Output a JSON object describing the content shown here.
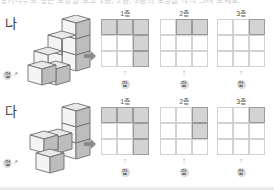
{
  "header": {
    "clipped_text": "쌓기나무로 쌓은 모양을 보고 1층, 2층, 3층의 모양을 각각 그려 보세요."
  },
  "front_marker": {
    "label": "앞"
  },
  "rows": [
    {
      "label": "나",
      "layers": [
        {
          "label": "1층",
          "cells": [
            1,
            1,
            1,
            0,
            0,
            1,
            0,
            0,
            1
          ]
        },
        {
          "label": "2층",
          "cells": [
            0,
            1,
            1,
            0,
            0,
            0,
            0,
            0,
            0
          ]
        },
        {
          "label": "3층",
          "cells": [
            0,
            0,
            1,
            0,
            0,
            0,
            0,
            0,
            0
          ]
        }
      ]
    },
    {
      "label": "다",
      "layers": [
        {
          "label": "1층",
          "cells": [
            1,
            1,
            1,
            0,
            0,
            1,
            0,
            0,
            1
          ]
        },
        {
          "label": "2층",
          "cells": [
            0,
            0,
            1,
            0,
            0,
            1,
            0,
            0,
            0
          ]
        },
        {
          "label": "3층",
          "cells": [
            0,
            0,
            1,
            0,
            0,
            0,
            0,
            0,
            0
          ]
        }
      ]
    }
  ],
  "colors": {
    "cube_top": "#e8e8e8",
    "cube_left": "#f4f4f4",
    "cube_right": "#bdbdbd",
    "cube_stroke": "#6f6f6f",
    "cell_fill": "#d3d3d3",
    "cell_fill_stroke": "#9b9b9b",
    "grid_line": "#d2d2d2",
    "arrow": "#8a8a8a"
  }
}
